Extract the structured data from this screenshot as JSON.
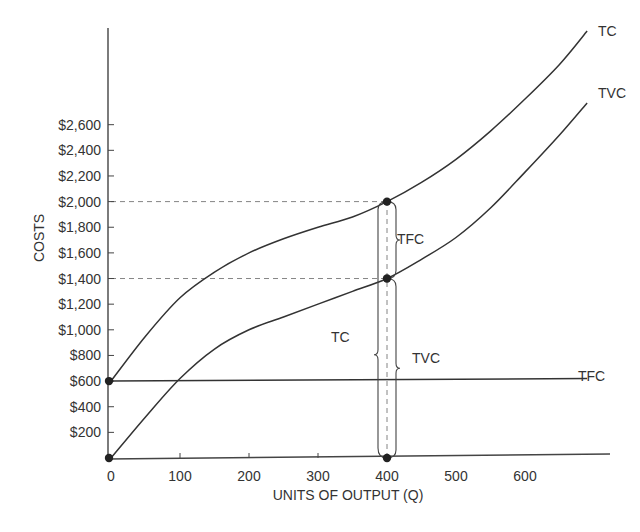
{
  "chart_data": {
    "type": "line",
    "title": "",
    "xlabel": "UNITS OF OUTPUT (Q)",
    "ylabel": "COSTS",
    "x_ticks": [
      0,
      100,
      200,
      300,
      400,
      500,
      600
    ],
    "x_tick_labels": [
      "0",
      "100",
      "200",
      "300",
      "400",
      "500",
      "600"
    ],
    "y_ticks": [
      200,
      400,
      600,
      800,
      1000,
      1200,
      1400,
      1600,
      1800,
      2000,
      2200,
      2400,
      2600
    ],
    "y_tick_labels": [
      "$200",
      "$400",
      "$600",
      "$800",
      "$1,000",
      "$1,200",
      "$1,400",
      "$1,600",
      "$1,800",
      "$2,000",
      "$2,200",
      "$2,400",
      "$2,600"
    ],
    "xlim": [
      0,
      700
    ],
    "ylim": [
      0,
      3300
    ],
    "grid": false,
    "series": [
      {
        "name": "TC",
        "x": [
          0,
          50,
          100,
          150,
          200,
          250,
          300,
          350,
          400,
          450,
          500,
          550,
          600,
          650,
          690
        ],
        "values": [
          600,
          950,
          1250,
          1450,
          1600,
          1710,
          1800,
          1880,
          2000,
          2150,
          2330,
          2550,
          2800,
          3070,
          3330
        ]
      },
      {
        "name": "TVC",
        "x": [
          0,
          50,
          100,
          150,
          200,
          250,
          300,
          350,
          400,
          450,
          500,
          550,
          600,
          650,
          690
        ],
        "values": [
          0,
          320,
          620,
          850,
          1000,
          1100,
          1200,
          1300,
          1400,
          1550,
          1720,
          1950,
          2230,
          2520,
          2770
        ]
      },
      {
        "name": "TFC",
        "x": [
          0,
          690
        ],
        "values": [
          600,
          620
        ]
      }
    ],
    "annotations": [
      {
        "type": "point",
        "x": 0,
        "y": 600
      },
      {
        "type": "point",
        "x": 0,
        "y": 0
      },
      {
        "type": "point",
        "x": 400,
        "y": 2000
      },
      {
        "type": "point",
        "x": 400,
        "y": 1400
      },
      {
        "type": "point",
        "x": 400,
        "y": 0
      },
      {
        "type": "dashed-hline",
        "y": 2000,
        "x_from": 0,
        "x_to": 400
      },
      {
        "type": "dashed-hline",
        "y": 1400,
        "x_from": 0,
        "x_to": 400
      },
      {
        "type": "dashed-vline",
        "x": 400,
        "y_from": 0,
        "y_to": 2000
      },
      {
        "type": "brace",
        "label": "TFC",
        "from": 1400,
        "to": 2000
      },
      {
        "type": "brace",
        "label": "TVC",
        "from": 0,
        "to": 1400
      },
      {
        "type": "brace",
        "label": "TC",
        "from": 0,
        "to": 2000
      }
    ]
  },
  "labels": {
    "curve_tc": "TC",
    "curve_tvc": "TVC",
    "curve_tfc": "TFC",
    "brace_tfc": "TFC",
    "brace_tvc": "TVC",
    "brace_tc": "TC",
    "xlabel": "UNITS OF OUTPUT (Q)",
    "ylabel": "COSTS"
  }
}
